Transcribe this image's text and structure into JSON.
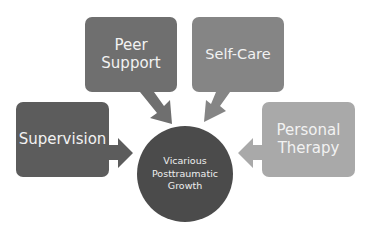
{
  "diagram": {
    "center": {
      "label_lines": [
        "Vicarious",
        "Posttraumatic",
        "Growth"
      ],
      "color": "#4b4b4b"
    },
    "nodes": [
      {
        "id": "peer-support",
        "label_lines": [
          "Peer",
          "Support"
        ],
        "color": "#6f6f6f"
      },
      {
        "id": "self-care",
        "label_lines": [
          "Self-Care"
        ],
        "color": "#858585"
      },
      {
        "id": "supervision",
        "label_lines": [
          "Supervision"
        ],
        "color": "#5c5c5c"
      },
      {
        "id": "personal-therapy",
        "label_lines": [
          "Personal",
          "Therapy"
        ],
        "color": "#a9a9a9"
      }
    ],
    "edges": [
      {
        "from": "peer-support",
        "to": "center"
      },
      {
        "from": "self-care",
        "to": "center"
      },
      {
        "from": "supervision",
        "to": "center"
      },
      {
        "from": "personal-therapy",
        "to": "center"
      }
    ]
  }
}
